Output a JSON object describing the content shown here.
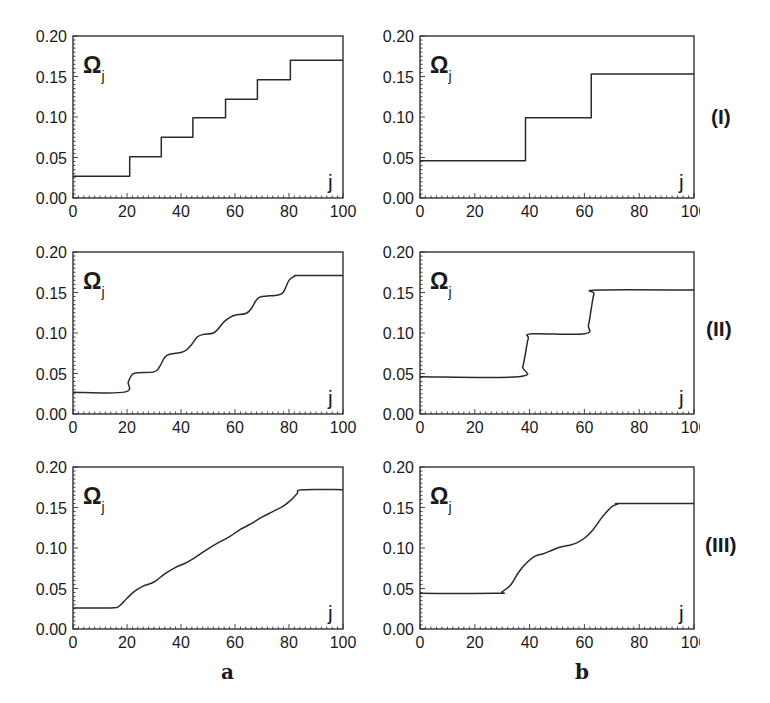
{
  "figure": {
    "column_labels": [
      "a",
      "b"
    ],
    "row_labels": [
      "(I)",
      "(II)",
      "(III)"
    ]
  },
  "chart_data": [
    {
      "id": "I-a",
      "row": "(I)",
      "column": "a",
      "type": "line",
      "title": "",
      "xlabel": "j",
      "ylabel": "Ω_j",
      "xlim": [
        0,
        100
      ],
      "ylim": [
        0,
        0.2
      ],
      "xticks": [
        0,
        20,
        40,
        60,
        80,
        100
      ],
      "yticks": [
        "0.00",
        "0.05",
        "0.10",
        "0.15",
        "0.20"
      ],
      "grid": false,
      "shape": "hv",
      "x": [
        0,
        21,
        32.7,
        44.4,
        56.5,
        68.3,
        80.5,
        100
      ],
      "y": [
        0.027,
        0.051,
        0.075,
        0.099,
        0.122,
        0.146,
        0.17,
        0.17
      ]
    },
    {
      "id": "I-b",
      "row": "(I)",
      "column": "b",
      "type": "line",
      "title": "",
      "xlabel": "j",
      "ylabel": "Ω_j",
      "xlim": [
        0,
        100
      ],
      "ylim": [
        0,
        0.2
      ],
      "xticks": [
        0,
        20,
        40,
        60,
        80,
        100
      ],
      "yticks": [
        "0.00",
        "0.05",
        "0.10",
        "0.15",
        "0.20"
      ],
      "grid": false,
      "shape": "hv",
      "x": [
        0,
        38.5,
        62.5,
        100
      ],
      "y": [
        0.046,
        0.099,
        0.153,
        0.153
      ]
    },
    {
      "id": "II-a",
      "row": "(II)",
      "column": "a",
      "type": "line",
      "title": "",
      "xlabel": "j",
      "ylabel": "Ω_j",
      "xlim": [
        0,
        100
      ],
      "ylim": [
        0,
        0.2
      ],
      "xticks": [
        0,
        20,
        40,
        60,
        80,
        100
      ],
      "yticks": [
        "0.00",
        "0.05",
        "0.10",
        "0.15",
        "0.20"
      ],
      "grid": false,
      "shape": "smooth",
      "x": [
        0,
        19,
        20.5,
        22,
        24,
        30,
        32,
        34,
        36,
        40,
        42,
        44,
        46,
        48,
        52,
        54,
        56,
        58,
        60,
        64,
        66,
        68,
        70,
        76,
        78,
        80,
        82,
        84,
        100
      ],
      "y": [
        0.027,
        0.027,
        0.04,
        0.049,
        0.051,
        0.052,
        0.058,
        0.07,
        0.074,
        0.076,
        0.079,
        0.086,
        0.095,
        0.098,
        0.1,
        0.106,
        0.114,
        0.119,
        0.122,
        0.124,
        0.13,
        0.141,
        0.145,
        0.147,
        0.151,
        0.165,
        0.17,
        0.171,
        0.171
      ]
    },
    {
      "id": "II-b",
      "row": "(II)",
      "column": "b",
      "type": "line",
      "title": "",
      "xlabel": "j",
      "ylabel": "Ω_j",
      "xlim": [
        0,
        100
      ],
      "ylim": [
        0,
        0.2
      ],
      "xticks": [
        0,
        20,
        40,
        60,
        80,
        100
      ],
      "yticks": [
        "0.00",
        "0.05",
        "0.10",
        "0.15",
        "0.20"
      ],
      "grid": false,
      "shape": "smooth",
      "x": [
        0,
        36,
        37.5,
        38.5,
        39.5,
        41,
        60,
        61.5,
        62.5,
        63.5,
        65,
        100
      ],
      "y": [
        0.046,
        0.046,
        0.058,
        0.075,
        0.093,
        0.099,
        0.099,
        0.11,
        0.13,
        0.148,
        0.153,
        0.153
      ]
    },
    {
      "id": "III-a",
      "row": "(III)",
      "column": "a",
      "type": "line",
      "title": "",
      "xlabel": "j",
      "ylabel": "Ω_j",
      "xlim": [
        0,
        100
      ],
      "ylim": [
        0,
        0.2
      ],
      "xticks": [
        0,
        20,
        40,
        60,
        80,
        100
      ],
      "yticks": [
        "0.00",
        "0.05",
        "0.10",
        "0.15",
        "0.20"
      ],
      "grid": false,
      "shape": "smooth",
      "x": [
        0,
        14,
        17,
        20,
        23,
        26,
        30,
        34,
        38,
        42,
        46,
        50,
        54,
        58,
        62,
        66,
        70,
        74,
        78,
        81,
        83,
        85,
        100
      ],
      "y": [
        0.026,
        0.026,
        0.028,
        0.038,
        0.047,
        0.053,
        0.058,
        0.068,
        0.076,
        0.082,
        0.09,
        0.099,
        0.107,
        0.114,
        0.123,
        0.13,
        0.138,
        0.145,
        0.152,
        0.16,
        0.167,
        0.172,
        0.172
      ]
    },
    {
      "id": "III-b",
      "row": "(III)",
      "column": "b",
      "type": "line",
      "title": "",
      "xlabel": "j",
      "ylabel": "Ω_j",
      "xlim": [
        0,
        100
      ],
      "ylim": [
        0,
        0.2
      ],
      "xticks": [
        0,
        20,
        40,
        60,
        80,
        100
      ],
      "yticks": [
        "0.00",
        "0.05",
        "0.10",
        "0.15",
        "0.20"
      ],
      "grid": false,
      "shape": "smooth",
      "x": [
        0,
        28,
        30,
        33,
        36,
        39,
        42,
        45,
        48,
        51,
        54,
        57,
        60,
        63,
        66,
        68,
        70,
        72,
        74,
        100
      ],
      "y": [
        0.044,
        0.044,
        0.046,
        0.054,
        0.07,
        0.082,
        0.09,
        0.093,
        0.097,
        0.101,
        0.103,
        0.106,
        0.112,
        0.122,
        0.136,
        0.144,
        0.151,
        0.154,
        0.155,
        0.155
      ]
    }
  ]
}
